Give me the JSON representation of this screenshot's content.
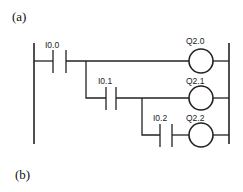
{
  "panels": {
    "a_label": "(a)",
    "b_label": "(b)"
  },
  "ladder": {
    "rungs": [
      {
        "contact": "I0.0",
        "coil": "Q2.0"
      },
      {
        "contact": "I0.1",
        "coil": "Q2.1"
      },
      {
        "contact": "I0.2",
        "coil": "Q2.2"
      }
    ]
  }
}
